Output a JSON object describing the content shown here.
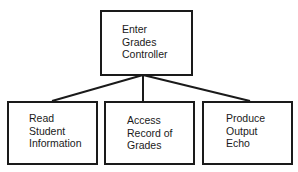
{
  "diagram": {
    "type": "structure-chart",
    "root": {
      "id": "enter-grades-controller",
      "label": "Enter\nGrades\nController"
    },
    "children": [
      {
        "id": "read-student-information",
        "label": "Read\nStudent\nInformation"
      },
      {
        "id": "access-record-of-grades",
        "label": "Access\nRecord of\nGrades"
      },
      {
        "id": "produce-output-echo",
        "label": "Produce\nOutput\nEcho"
      }
    ],
    "edges": [
      {
        "from": "enter-grades-controller",
        "to": "read-student-information"
      },
      {
        "from": "enter-grades-controller",
        "to": "access-record-of-grades"
      },
      {
        "from": "enter-grades-controller",
        "to": "produce-output-echo"
      }
    ],
    "colors": {
      "stroke": "#1a1a1a",
      "background": "#ffffff",
      "text": "#1a1a1a"
    }
  }
}
